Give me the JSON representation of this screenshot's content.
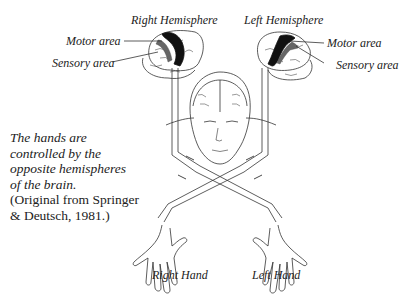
{
  "figure": {
    "labels": {
      "right_hemisphere": "Right Hemisphere",
      "left_hemisphere": "Left Hemisphere",
      "motor_area_left_side": "Motor area",
      "sensory_area_left_side": "Sensory area",
      "motor_area_right_side": "Motor area",
      "sensory_area_right_side": "Sensory area",
      "right_hand": "Right Hand",
      "left_hand": "Left Hand"
    },
    "caption": {
      "line1": "The hands are",
      "line2": "controlled by the",
      "line3": "opposite hemispheres",
      "line4": "of the brain.",
      "citation1": "(Original from Springer",
      "citation2": "& Deutsch, 1981.)"
    }
  }
}
